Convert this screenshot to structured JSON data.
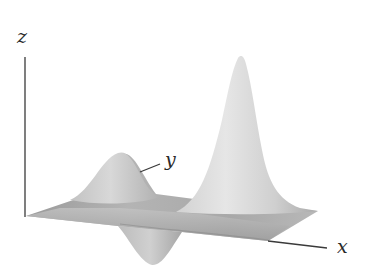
{
  "figure": {
    "type": "3d-surface-plot",
    "axes": {
      "x": {
        "label": "x"
      },
      "y": {
        "label": "y"
      },
      "z": {
        "label": "z"
      }
    },
    "features": [
      {
        "name": "tall-peak",
        "kind": "maximum"
      },
      {
        "name": "small-hump",
        "kind": "maximum"
      },
      {
        "name": "dip",
        "kind": "minimum"
      }
    ],
    "colors": {
      "background": "#ffffff",
      "axis": "#3a3a3a",
      "surface_light": "#ececec",
      "surface_mid": "#bdbdbd",
      "surface_dark": "#8a8a8a"
    }
  }
}
